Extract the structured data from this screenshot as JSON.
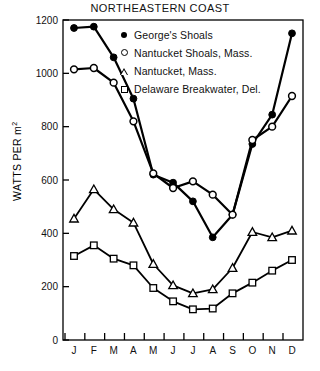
{
  "chart_data": {
    "type": "line",
    "title": "NORTHEASTERN COAST",
    "xlabel": "",
    "ylabel": "WATTS PER m2",
    "ylabel_main": "WATTS PER m",
    "ylabel_sup": "2",
    "categories": [
      "J",
      "F",
      "M",
      "A",
      "M",
      "J",
      "J",
      "A",
      "S",
      "O",
      "N",
      "D"
    ],
    "category_names": [
      "January",
      "February",
      "March",
      "April",
      "May",
      "June",
      "July",
      "August",
      "September",
      "October",
      "November",
      "December"
    ],
    "ylim": [
      0,
      1200
    ],
    "yticks": [
      0,
      200,
      400,
      600,
      800,
      1000,
      1200
    ],
    "ytick_labels": [
      "0",
      "200",
      "400",
      "600",
      "800",
      "1000",
      "1200"
    ],
    "grid": false,
    "legend_position": "top-right-inside",
    "series": [
      {
        "name": "George's Shoals",
        "marker": "filled-circle",
        "values": [
          1170,
          1175,
          1060,
          905,
          620,
          590,
          520,
          385,
          470,
          735,
          845,
          1150
        ]
      },
      {
        "name": "Nantucket Shoals, Mass.",
        "marker": "open-circle",
        "values": [
          1015,
          1020,
          965,
          820,
          625,
          570,
          595,
          545,
          470,
          750,
          800,
          915
        ]
      },
      {
        "name": "Nantucket, Mass.",
        "marker": "open-triangle",
        "values": [
          455,
          565,
          490,
          440,
          285,
          205,
          175,
          190,
          270,
          405,
          385,
          410
        ]
      },
      {
        "name": "Delaware Breakwater, Del.",
        "marker": "open-square",
        "values": [
          315,
          355,
          305,
          280,
          195,
          145,
          115,
          118,
          175,
          215,
          260,
          300
        ]
      }
    ]
  },
  "legend": {
    "items": [
      {
        "label": "George's Shoals",
        "marker": "filled-circle"
      },
      {
        "label": "Nantucket Shoals, Mass.",
        "marker": "open-circle"
      },
      {
        "label": "Nantucket, Mass.",
        "marker": "open-triangle"
      },
      {
        "label": "Delaware Breakwater, Del.",
        "marker": "open-square"
      }
    ]
  }
}
